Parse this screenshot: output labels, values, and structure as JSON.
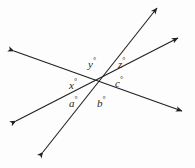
{
  "figure": {
    "background_color": "#fdfdfd",
    "stroke_color": "#231f20",
    "width": 195,
    "height": 168,
    "intersection": {
      "x": 97,
      "y": 80
    },
    "lines": [
      {
        "name": "line-upper-left-to-lower-right",
        "description": "shallow line descending from upper left to lower right",
        "from": {
          "x": 14,
          "y": 51
        },
        "to": {
          "x": 182,
          "y": 111
        },
        "arrow_start": true,
        "arrow_end": true
      },
      {
        "name": "line-lower-left-to-upper-right",
        "description": "shallow line rising from lower left to upper right",
        "from": {
          "x": 16,
          "y": 121
        },
        "to": {
          "x": 178,
          "y": 38
        },
        "arrow_start": true,
        "arrow_end": true
      },
      {
        "name": "line-lower-left-steep-to-upper-right-steep",
        "description": "steep line rising from lower left to upper right",
        "from": {
          "x": 43,
          "y": 152
        },
        "to": {
          "x": 157,
          "y": 8
        },
        "arrow_start": true,
        "arrow_end": true
      }
    ],
    "labels": [
      {
        "id": "y",
        "symbol": "y",
        "degree_mark": "°",
        "x": 88,
        "y": 57
      },
      {
        "id": "z",
        "symbol": "z",
        "degree_mark": "°",
        "x": 118,
        "y": 57
      },
      {
        "id": "c",
        "symbol": "c",
        "degree_mark": "°",
        "x": 115,
        "y": 76
      },
      {
        "id": "x",
        "symbol": "x",
        "degree_mark": "°",
        "x": 69,
        "y": 78
      },
      {
        "id": "a",
        "symbol": "a",
        "degree_mark": "°",
        "x": 69,
        "y": 96
      },
      {
        "id": "b",
        "symbol": "b",
        "degree_mark": "°",
        "x": 97,
        "y": 96
      }
    ]
  }
}
